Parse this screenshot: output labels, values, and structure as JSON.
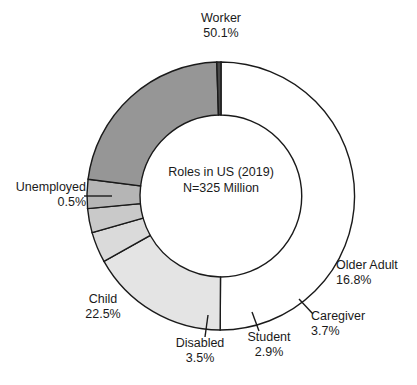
{
  "chart_data": {
    "type": "pie",
    "variant": "donut",
    "title": "Roles in US (2019)",
    "subtitle": "N=325 Million",
    "center_lines": [
      "Roles in US (2019)",
      "N=325 Million"
    ],
    "xlabel": "",
    "ylabel": "",
    "grid": false,
    "legend": "none (direct labels with leader lines)",
    "value_unit": "percent",
    "total_percent": 100.0,
    "total_population": "325 Million",
    "start_angle_deg": -90,
    "direction": "clockwise",
    "categories": [
      "Worker",
      "Older Adult",
      "Caregiver",
      "Student",
      "Disabled",
      "Child",
      "Unemployed"
    ],
    "values": [
      50.1,
      16.8,
      3.7,
      2.9,
      3.5,
      22.5,
      0.5
    ],
    "colors": [
      "#ffffff",
      "#e4e4e4",
      "#dadada",
      "#c9c9c9",
      "#b5b5b5",
      "#969696",
      "#4a4a4a"
    ],
    "stroke_color": "#1a1a1a",
    "slices": [
      {
        "label": "Worker",
        "value": 50.1,
        "value_text": "50.1%",
        "color": "#ffffff",
        "label_align": "center"
      },
      {
        "label": "Older Adult",
        "value": 16.8,
        "value_text": "16.8%",
        "color": "#e4e4e4",
        "label_align": "left"
      },
      {
        "label": "Caregiver",
        "value": 3.7,
        "value_text": "3.7%",
        "color": "#dadada",
        "label_align": "left"
      },
      {
        "label": "Student",
        "value": 2.9,
        "value_text": "2.9%",
        "color": "#c9c9c9",
        "label_align": "center"
      },
      {
        "label": "Disabled",
        "value": 3.5,
        "value_text": "3.5%",
        "color": "#b5b5b5",
        "label_align": "center"
      },
      {
        "label": "Child",
        "value": 22.5,
        "value_text": "22.5%",
        "color": "#969696",
        "label_align": "center"
      },
      {
        "label": "Unemployed",
        "value": 0.5,
        "value_text": "0.5%",
        "color": "#4a4a4a",
        "label_align": "right"
      }
    ]
  },
  "geometry": {
    "center_x": 221,
    "center_y": 196,
    "outer_radius": 134,
    "inner_radius": 81
  }
}
